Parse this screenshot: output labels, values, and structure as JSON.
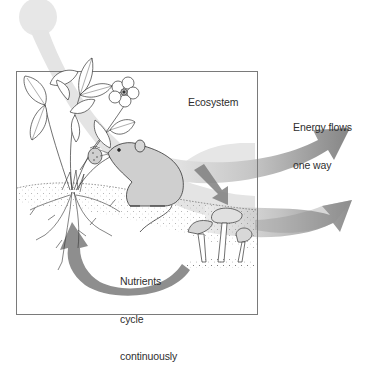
{
  "diagram": {
    "title": "Ecosystem",
    "labels": {
      "ecosystem": "Ecosystem",
      "energy_line1": "Energy flows",
      "energy_line2": "one way",
      "nutrients_line1": "Nutrients",
      "nutrients_line2": "cycle",
      "nutrients_line3": "continuously"
    },
    "elements": {
      "sun": "sun",
      "energy_beam": "sunlight beam entering ecosystem",
      "ecosystem_box": "ecosystem boundary box",
      "plant": "strawberry plant with leaves, flower, fruit and roots",
      "consumer": "mouse eating strawberry",
      "decomposer": "mushrooms",
      "energy_arrows": [
        "upper energy arrow leaving ecosystem",
        "lower energy arrow leaving ecosystem"
      ],
      "nutrient_arrow": "curved nutrient cycle arrow from decomposers back to plant roots",
      "transfer_arrow": "arrow from consumer down to decomposers"
    },
    "colors": {
      "sun": "#e6e6e6",
      "beam": "#e2e2e2",
      "energy_arrow_dark": "#8a8a8a",
      "energy_arrow_light": "#dcdcdc",
      "nutrient_arrow": "#8f8f8f",
      "box_border": "#7a7a7a",
      "ink": "#333333"
    }
  }
}
